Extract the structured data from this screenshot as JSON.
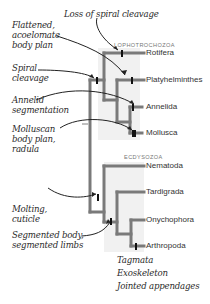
{
  "diagram": {
    "type": "phylogenetic-tree",
    "clades": [
      {
        "label": "LOPHOTROCHOZOA",
        "taxa": [
          "Rotifera",
          "Platyhelminthes",
          "Annelida",
          "Mollusca"
        ]
      },
      {
        "label": "ECDYSOZOA",
        "taxa": [
          "Nematoda",
          "Tardigrada",
          "Onychophora",
          "Arthropoda"
        ]
      }
    ],
    "taxa": [
      "Rotifera",
      "Platyhelminthes",
      "Annelida",
      "Mollusca",
      "Nematoda",
      "Tardigrada",
      "Onychophora",
      "Arthropoda"
    ],
    "annotations": {
      "flattened": [
        "Flattened,",
        "acoelomate",
        "body plan"
      ],
      "loss_spiral": "Loss of spiral cleavage",
      "spiral": [
        "Spiral",
        "cleavage"
      ],
      "annelid": [
        "Annelid",
        "segmentation"
      ],
      "molluscan": [
        "Molluscan",
        "body plan,",
        "radula"
      ],
      "molting": [
        "Molting,",
        "cuticle"
      ],
      "segmented": [
        "Segmented body,",
        "segmented limbs"
      ],
      "arthropod": [
        "Tagmata",
        "Exoskeleton",
        "Jointed appendages"
      ]
    },
    "colors": {
      "branch": "#7a7a7a",
      "shade": "#f1f1f1",
      "marker": "#111111",
      "text": "#2b2b2b"
    }
  }
}
